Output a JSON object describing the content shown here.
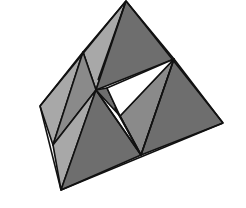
{
  "figure": {
    "title": "",
    "shades": {
      "dark": "#6e6e6e",
      "medium": "#8a8a8a",
      "light": "#a8a8a8",
      "void": "#ffffff",
      "edge": "#111111"
    }
  }
}
